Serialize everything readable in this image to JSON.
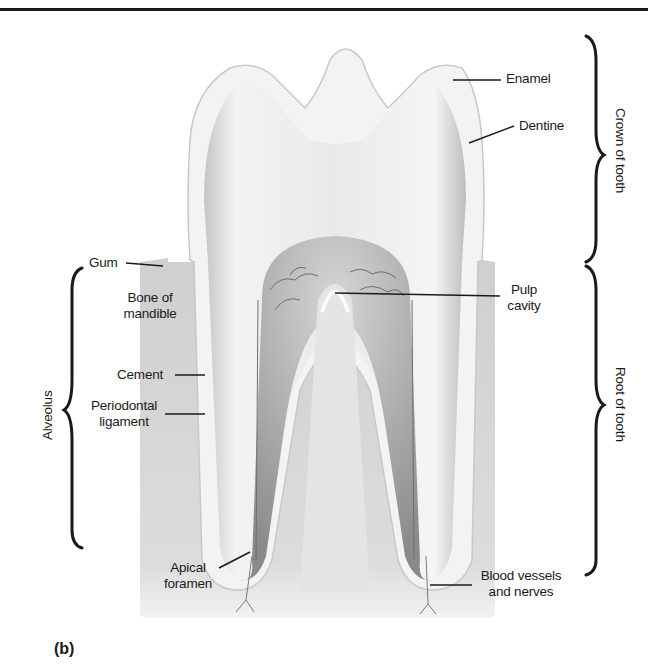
{
  "figure": {
    "panel_label": "(b)",
    "labels": {
      "enamel": "Enamel",
      "dentine": "Dentine",
      "gum": "Gum",
      "bone_of_mandible_line1": "Bone of",
      "bone_of_mandible_line2": "mandible",
      "pulp_cavity_line1": "Pulp",
      "pulp_cavity_line2": "cavity",
      "cement": "Cement",
      "periodontal_ligament_line1": "Periodontal",
      "periodontal_ligament_line2": "ligament",
      "apical_foramen_line1": "Apical",
      "apical_foramen_line2": "foramen",
      "blood_vessels_line1": "Blood vessels",
      "blood_vessels_line2": "and nerves"
    },
    "brackets": {
      "crown": "Crown of tooth",
      "root": "Root of tooth",
      "alveolus": "Alveolus"
    },
    "colors": {
      "background": "#ffffff",
      "bone": "#d9d9d9",
      "enamel": "#f4f4f4",
      "dentine": "#e2e2e2",
      "pulp": "#9a9a9a",
      "line": "#1a1a1a"
    }
  }
}
